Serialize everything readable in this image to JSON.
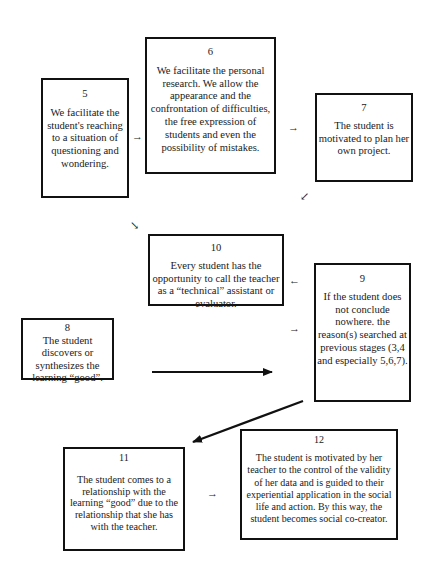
{
  "diagram": {
    "type": "flowchart",
    "boxes": [
      {
        "id": "5",
        "number": "5",
        "text": "We facilitate the student's reaching to a situation of questioning and wondering."
      },
      {
        "id": "6",
        "number": "6",
        "text": "We facilitate the personal research. We allow the appearance and the confrontation of difficulties, the free expression of students and even the possibility of mistakes."
      },
      {
        "id": "7",
        "number": "7",
        "text": "The student is motivated to plan her own project."
      },
      {
        "id": "10",
        "number": "10",
        "text": "Every student has the opportunity to call the teacher as a “technical” assistant or evaluator."
      },
      {
        "id": "9",
        "number": "9",
        "text": "If the student does not conclude nowhere. the reason(s) searched at previous stages (3,4 and especially 5,6,7)."
      },
      {
        "id": "8",
        "number": "8",
        "text": "The student discovers or synthesizes the learning “good”."
      },
      {
        "id": "11",
        "number": "11",
        "text": "The student comes to a relationship with the learning “good” due to the relationship that she has with the teacher."
      },
      {
        "id": "12",
        "number": "12",
        "text": "The student is motivated by her teacher to the control of the validity of her data and is guided to their experiential application in the social life and action. By  this way, the student becomes social co-creator."
      }
    ],
    "arrows": [
      {
        "from": "5",
        "to": "6",
        "glyph": "→",
        "style": "small"
      },
      {
        "from": "6",
        "to": "7",
        "glyph": "→",
        "style": "small"
      },
      {
        "from": "7",
        "to": "9",
        "glyph": "↙",
        "style": "small"
      },
      {
        "from": "9",
        "to": "10",
        "glyph": "←",
        "style": "small"
      },
      {
        "from": "10",
        "to": "9",
        "glyph": "→",
        "style": "small"
      },
      {
        "from": "diag",
        "to": "10",
        "glyph": "↘",
        "style": "small"
      },
      {
        "from": "8",
        "to": "9",
        "style": "long"
      },
      {
        "from": "9",
        "to": "11",
        "style": "long-diagonal"
      },
      {
        "from": "11",
        "to": "12",
        "glyph": "→",
        "style": "small"
      }
    ]
  }
}
